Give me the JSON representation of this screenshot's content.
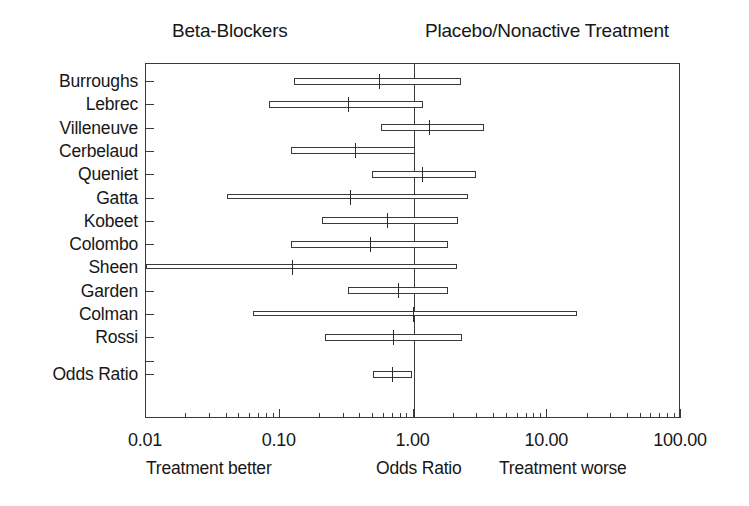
{
  "header": {
    "left_label": "Beta-Blockers",
    "right_label": "Placebo/Nonactive Treatment"
  },
  "footer": {
    "left_label": "Treatment better",
    "center_label": "Odds Ratio",
    "right_label": "Treatment worse"
  },
  "chart_data": {
    "type": "forest",
    "title": "",
    "xlabel": "Odds Ratio",
    "ylabel": "",
    "xscale": "log",
    "xlim": [
      0.01,
      100.0
    ],
    "grid": false,
    "reference_line": 1.0,
    "legend": "none",
    "left_group": "Beta-Blockers",
    "right_group": "Placebo/Nonactive Treatment",
    "x_tick_labels": [
      "0.01",
      "0.10",
      "1.00",
      "10.00",
      "100.00"
    ],
    "x_tick_values": [
      0.01,
      0.1,
      1.0,
      10.0,
      100.0
    ],
    "annotations": {
      "left": "Treatment better",
      "center": "Odds Ratio",
      "right": "Treatment worse"
    },
    "studies": [
      {
        "label": "Burroughs",
        "odds_ratio": 0.56,
        "ci_low": 0.13,
        "ci_high": 2.3,
        "clipped_low": false
      },
      {
        "label": "Lebrec",
        "odds_ratio": 0.33,
        "ci_low": 0.085,
        "ci_high": 1.2,
        "clipped_low": false
      },
      {
        "label": "Villeneuve",
        "odds_ratio": 1.32,
        "ci_low": 0.58,
        "ci_high": 3.4,
        "clipped_low": false
      },
      {
        "label": "Cerbelaud",
        "odds_ratio": 0.37,
        "ci_low": 0.124,
        "ci_high": 1.04,
        "clipped_low": false
      },
      {
        "label": "Queniet",
        "odds_ratio": 1.17,
        "ci_low": 0.5,
        "ci_high": 3.0,
        "clipped_low": false
      },
      {
        "label": "Gatta",
        "odds_ratio": 0.34,
        "ci_low": 0.041,
        "ci_high": 2.6,
        "clipped_low": false
      },
      {
        "label": "Kobeet",
        "odds_ratio": 0.65,
        "ci_low": 0.21,
        "ci_high": 2.2,
        "clipped_low": false
      },
      {
        "label": "Colombo",
        "odds_ratio": 0.48,
        "ci_low": 0.124,
        "ci_high": 1.85,
        "clipped_low": false
      },
      {
        "label": "Sheen",
        "odds_ratio": 0.125,
        "ci_low": 0.01,
        "ci_high": 2.15,
        "clipped_low": true
      },
      {
        "label": "Garden",
        "odds_ratio": 0.78,
        "ci_low": 0.33,
        "ci_high": 1.85,
        "clipped_low": false
      },
      {
        "label": "Colman",
        "odds_ratio": 1.0,
        "ci_low": 0.064,
        "ci_high": 17.0,
        "clipped_low": false
      },
      {
        "label": "Rossi",
        "odds_ratio": 0.72,
        "ci_low": 0.22,
        "ci_high": 2.35,
        "clipped_low": false
      }
    ],
    "summary": {
      "label": "Odds Ratio",
      "odds_ratio": 0.7,
      "ci_low": 0.505,
      "ci_high": 1.0
    }
  }
}
